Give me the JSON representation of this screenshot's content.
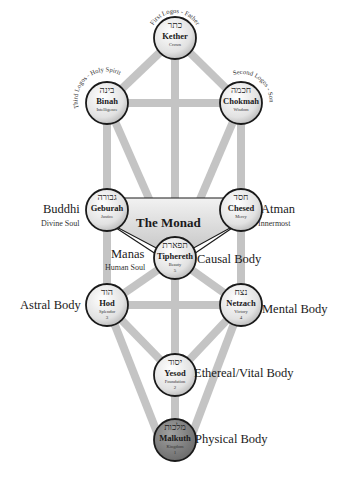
{
  "colors": {
    "path": "#c4c4c4",
    "node_fill": "#e6e6e6",
    "node_stroke": "#1a1a1a",
    "malkuth_fill": "#8a8a8a",
    "monad_fill": "#dadada",
    "text": "#1a1a1a"
  },
  "nodes": [
    {
      "id": "kether",
      "hebrew": "כתר",
      "name": "Kether",
      "meaning": "Crown",
      "number": "",
      "arc": "First Logos - Father"
    },
    {
      "id": "binah",
      "hebrew": "בינה",
      "name": "Binah",
      "meaning": "Intelligence",
      "number": "",
      "arc": "Third Logos - Holy Spirit"
    },
    {
      "id": "chokmah",
      "hebrew": "חכמה",
      "name": "Chokmah",
      "meaning": "Wisdom",
      "number": "",
      "arc": "Second Logos - Son"
    },
    {
      "id": "geburah",
      "hebrew": "גבורה",
      "name": "Geburah",
      "meaning": "Justice",
      "number": ""
    },
    {
      "id": "chesed",
      "hebrew": "חסד",
      "name": "Chesed",
      "meaning": "Mercy",
      "number": ""
    },
    {
      "id": "tiphereth",
      "hebrew": "תפארת",
      "name": "Tiphereth",
      "meaning": "Beauty",
      "number": "5"
    },
    {
      "id": "hod",
      "hebrew": "הוד",
      "name": "Hod",
      "meaning": "Splendor",
      "number": "3"
    },
    {
      "id": "netzach",
      "hebrew": "נצח",
      "name": "Netzach",
      "meaning": "Victory",
      "number": "4"
    },
    {
      "id": "yesod",
      "hebrew": "יסוד",
      "name": "Yesod",
      "meaning": "Foundation",
      "number": "2"
    },
    {
      "id": "malkuth",
      "hebrew": "מלכות",
      "name": "Malkuth",
      "meaning": "Kingdom",
      "number": "1"
    }
  ],
  "monad": "The Monad",
  "labels": {
    "buddhi": {
      "title": "Buddhi",
      "sub": "Divine Soul"
    },
    "atman": {
      "title": "Atman",
      "sub": "Innermost"
    },
    "manas": {
      "title": "Manas",
      "sub": "Human Soul"
    },
    "causal": "Causal Body",
    "astral": "Astral Body",
    "mental": "Mental Body",
    "ethereal": "Ethereal/Vital Body",
    "physical": "Physical Body"
  }
}
